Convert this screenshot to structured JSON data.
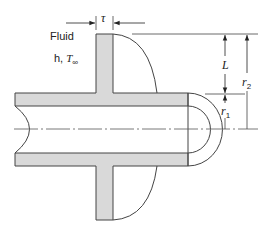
{
  "diagram": {
    "colors": {
      "fin_fill": "#d9d9d9",
      "stroke": "#333333",
      "background": "#ffffff"
    },
    "labels": {
      "fluid": "Fluid",
      "h_prefix": "h, ",
      "t_inf": "T",
      "t_inf_sub": "∞",
      "tau": "τ",
      "L": "L",
      "r2": "r",
      "r2_sub": "2",
      "r1": "r",
      "r1_sub": "1"
    }
  }
}
